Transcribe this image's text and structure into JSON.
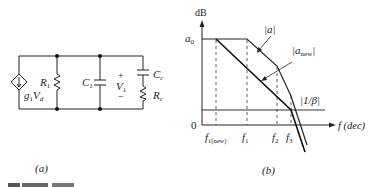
{
  "figure_a": {
    "caption": "(a)",
    "source_label_main": "g",
    "source_label_sub1": "1",
    "source_label_V": "V",
    "source_label_sub2": "d",
    "r1_main": "R",
    "r1_sub": "1",
    "c1_main": "C",
    "c1_sub": "1",
    "v1_plus": "+",
    "v1_main": "V",
    "v1_sub": "1",
    "v1_minus": "−",
    "cc_main": "C",
    "cc_sub": "c",
    "rc_main": "R",
    "rc_sub": "c"
  },
  "figure_b": {
    "caption": "(b)",
    "y_axis_label": "dB",
    "a0_main": "a",
    "a0_sub": "0",
    "zero_label": "0",
    "x_axis_label": "f (dec)",
    "curve_a_label": "|a|",
    "curve_anew_main": "|a",
    "curve_anew_sub": "new",
    "curve_anew_close": "|",
    "beta_label": "|1/β|",
    "ticks": [
      {
        "main": "f",
        "sub": "1(new)"
      },
      {
        "main": "f",
        "sub": "1"
      },
      {
        "main": "f",
        "sub": "2"
      },
      {
        "main": "f",
        "sub": "3"
      }
    ]
  },
  "figure_caption_partial": "FIGURE 9.14"
}
